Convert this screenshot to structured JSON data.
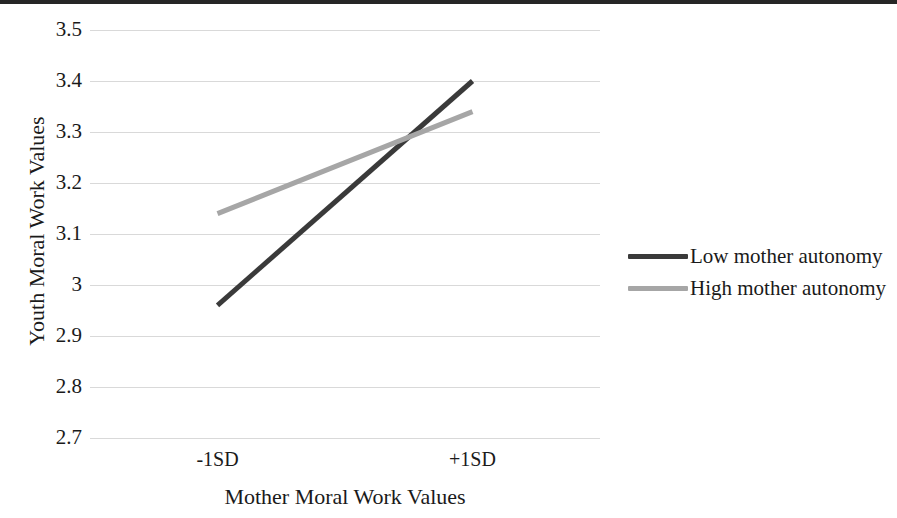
{
  "chart_data": {
    "type": "line",
    "title": "",
    "xlabel": "Mother Moral Work Values",
    "ylabel": "Youth Moral Work Values",
    "categories": [
      "-1SD",
      "+1SD"
    ],
    "x": [
      0,
      1
    ],
    "series": [
      {
        "name": "Low mother autonomy",
        "values": [
          2.96,
          3.4
        ],
        "color": "#3a3a3a",
        "linewidth": 5
      },
      {
        "name": "High mother autonomy",
        "values": [
          3.14,
          3.34
        ],
        "color": "#a6a6a6",
        "linewidth": 5
      }
    ],
    "ylim": [
      2.7,
      3.5
    ],
    "ytick_labels": [
      "3.5",
      "3.4",
      "3.3",
      "3.2",
      "3.1",
      "3",
      "2.9",
      "2.8",
      "2.7"
    ],
    "ytick_values": [
      3.5,
      3.4,
      3.3,
      3.2,
      3.1,
      3.0,
      2.9,
      2.8,
      2.7
    ],
    "grid": true,
    "grid_color": "#d9d9d9",
    "legend_position": "right",
    "legend_entries": [
      "Low mother autonomy",
      "High mother autonomy"
    ],
    "annotations": []
  },
  "axes": {
    "y_title": "Youth Moral Work Values",
    "x_title": "Mother Moral Work Values",
    "y_ticks": [
      "3.5",
      "3.4",
      "3.3",
      "3.2",
      "3.1",
      "3",
      "2.9",
      "2.8",
      "2.7"
    ],
    "x_ticks": [
      "-1SD",
      "+1SD"
    ]
  },
  "legend": {
    "items": [
      {
        "label": "Low mother autonomy",
        "color": "#3a3a3a"
      },
      {
        "label": "High mother autonomy",
        "color": "#a6a6a6"
      }
    ]
  }
}
